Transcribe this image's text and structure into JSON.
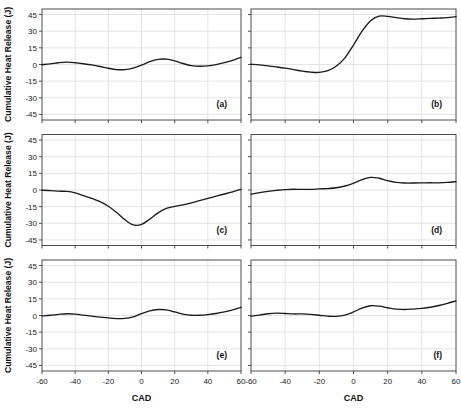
{
  "figure": {
    "width": 461,
    "height": 417,
    "background": "#ffffff",
    "curve_color": "#1a1a1a",
    "frame_color": "#4d4d4d",
    "grid_color": "#d8d8d8"
  },
  "axes": {
    "x_title": "CAD",
    "y_title": "Cumulative Heat Release (J)",
    "xlim": [
      -60,
      60
    ],
    "ylim": [
      -50,
      50
    ],
    "xticks": [
      -60,
      -40,
      -20,
      0,
      20,
      40,
      60
    ],
    "xtick_labels": [
      "-60",
      "-40",
      "-20",
      "0",
      "20",
      "40",
      "60"
    ],
    "yticks": [
      45,
      30,
      15,
      0,
      -15,
      -30,
      -45
    ],
    "ytick_labels": [
      "45",
      "30",
      "15",
      "0",
      "-15",
      "-30",
      "-45"
    ],
    "grid": true,
    "legend": "none"
  },
  "chart_data": {
    "type": "line",
    "title": "",
    "xlabel": "CAD",
    "ylabel": "Cumulative Heat Release (J)",
    "xlim": [
      -60,
      60
    ],
    "ylim": [
      -50,
      50
    ],
    "grid": true,
    "panels": [
      {
        "id": "a",
        "label": "(a)",
        "row": 0,
        "col": 0,
        "x": [
          -60,
          -55,
          -50,
          -45,
          -40,
          -35,
          -30,
          -25,
          -20,
          -15,
          -10,
          -5,
          0,
          5,
          10,
          15,
          20,
          25,
          30,
          35,
          40,
          45,
          50,
          55,
          60
        ],
        "y": [
          -0.2,
          0.6,
          1.6,
          2.1,
          1.6,
          0.7,
          -0.4,
          -1.8,
          -3.4,
          -4.6,
          -4.6,
          -3.2,
          -0.6,
          2.6,
          4.6,
          4.8,
          3.3,
          0.9,
          -1.0,
          -1.6,
          -1.2,
          -0.1,
          1.6,
          3.8,
          6.4
        ]
      },
      {
        "id": "b",
        "label": "(b)",
        "row": 0,
        "col": 1,
        "x": [
          -60,
          -55,
          -50,
          -45,
          -40,
          -35,
          -30,
          -25,
          -20,
          -15,
          -10,
          -5,
          0,
          5,
          10,
          15,
          20,
          25,
          30,
          35,
          40,
          45,
          50,
          55,
          60
        ],
        "y": [
          0.2,
          -0.4,
          -1.2,
          -2.2,
          -3.3,
          -4.6,
          -6.0,
          -6.9,
          -7.1,
          -5.6,
          -1.4,
          6.0,
          17.5,
          30.0,
          39.5,
          43.6,
          43.4,
          42.2,
          41.2,
          40.9,
          41.2,
          41.6,
          41.8,
          42.2,
          43.2
        ]
      },
      {
        "id": "c",
        "label": "(c)",
        "row": 1,
        "col": 0,
        "x": [
          -60,
          -55,
          -50,
          -45,
          -40,
          -35,
          -30,
          -25,
          -20,
          -15,
          -10,
          -5,
          0,
          5,
          10,
          15,
          20,
          25,
          30,
          35,
          40,
          45,
          50,
          55,
          60
        ],
        "y": [
          -0.2,
          -0.5,
          -1.0,
          -1.3,
          -2.6,
          -5.0,
          -7.6,
          -10.4,
          -14.6,
          -20.2,
          -26.8,
          -31.4,
          -31.0,
          -26.2,
          -20.6,
          -16.6,
          -14.8,
          -13.4,
          -11.6,
          -9.6,
          -7.6,
          -5.6,
          -3.6,
          -1.6,
          0.6
        ]
      },
      {
        "id": "d",
        "label": "(d)",
        "row": 1,
        "col": 1,
        "x": [
          -60,
          -55,
          -50,
          -45,
          -40,
          -35,
          -30,
          -25,
          -20,
          -15,
          -10,
          -5,
          0,
          5,
          10,
          15,
          20,
          25,
          30,
          35,
          40,
          45,
          50,
          55,
          60
        ],
        "y": [
          -3.8,
          -2.4,
          -1.2,
          -0.3,
          0.4,
          0.7,
          0.5,
          0.6,
          1.0,
          1.3,
          2.0,
          3.6,
          6.2,
          9.3,
          11.4,
          10.6,
          8.4,
          6.8,
          6.3,
          6.3,
          6.4,
          6.5,
          6.4,
          6.8,
          7.6
        ]
      },
      {
        "id": "e",
        "label": "(e)",
        "row": 2,
        "col": 0,
        "x": [
          -60,
          -55,
          -50,
          -45,
          -40,
          -35,
          -30,
          -25,
          -20,
          -15,
          -10,
          -5,
          0,
          5,
          10,
          15,
          20,
          25,
          30,
          35,
          40,
          45,
          50,
          55,
          60
        ],
        "y": [
          -0.4,
          0.2,
          1.0,
          1.6,
          1.2,
          0.3,
          -0.6,
          -1.4,
          -2.2,
          -2.8,
          -2.6,
          -1.2,
          1.6,
          4.2,
          5.4,
          5.0,
          3.2,
          1.2,
          0.2,
          0.2,
          0.8,
          1.8,
          3.2,
          5.0,
          7.4
        ]
      },
      {
        "id": "f",
        "label": "(f)",
        "row": 2,
        "col": 1,
        "x": [
          -60,
          -55,
          -50,
          -45,
          -40,
          -35,
          -30,
          -25,
          -20,
          -15,
          -10,
          -5,
          0,
          5,
          10,
          15,
          20,
          25,
          30,
          35,
          40,
          45,
          50,
          55,
          60
        ],
        "y": [
          -0.6,
          0.4,
          1.6,
          2.2,
          1.8,
          1.4,
          1.4,
          1.0,
          0.2,
          -0.6,
          -0.8,
          0.4,
          3.2,
          6.6,
          8.8,
          8.4,
          7.0,
          5.8,
          5.4,
          5.8,
          6.4,
          7.4,
          9.0,
          11.0,
          13.2
        ]
      }
    ]
  }
}
